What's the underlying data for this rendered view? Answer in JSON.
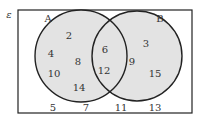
{
  "universal_label": "ε",
  "sets": {
    "A": {
      "label": "A",
      "only": [
        "2",
        "4",
        "8",
        "10",
        "14"
      ]
    },
    "B": {
      "label": "B",
      "only": [
        "3",
        "9",
        "15"
      ]
    },
    "intersection": [
      "6",
      "12"
    ],
    "outside": [
      "5",
      "7",
      "11",
      "13"
    ]
  },
  "colors": {
    "fill": "#e3e3e3",
    "stroke": "#222222"
  },
  "labels": [
    {
      "key": "set_a",
      "text": "A",
      "x": 48,
      "y": 19
    },
    {
      "key": "set_b",
      "text": "B",
      "x": 160,
      "y": 19
    },
    {
      "key": "n2",
      "text": "2",
      "x": 69,
      "y": 36
    },
    {
      "key": "n4",
      "text": "4",
      "x": 51,
      "y": 54
    },
    {
      "key": "n8",
      "text": "8",
      "x": 78,
      "y": 62
    },
    {
      "key": "n10",
      "text": "10",
      "x": 54,
      "y": 74
    },
    {
      "key": "n14",
      "text": "14",
      "x": 79,
      "y": 88
    },
    {
      "key": "n6",
      "text": "6",
      "x": 105,
      "y": 50
    },
    {
      "key": "n12",
      "text": "12",
      "x": 104,
      "y": 71
    },
    {
      "key": "n3",
      "text": "3",
      "x": 146,
      "y": 44
    },
    {
      "key": "n9",
      "text": "9",
      "x": 132,
      "y": 62
    },
    {
      "key": "n15",
      "text": "15",
      "x": 155,
      "y": 74
    },
    {
      "key": "n5",
      "text": "5",
      "x": 53,
      "y": 108
    },
    {
      "key": "n7",
      "text": "7",
      "x": 86,
      "y": 108
    },
    {
      "key": "n11",
      "text": "11",
      "x": 121,
      "y": 108
    },
    {
      "key": "n13",
      "text": "13",
      "x": 155,
      "y": 108
    }
  ]
}
